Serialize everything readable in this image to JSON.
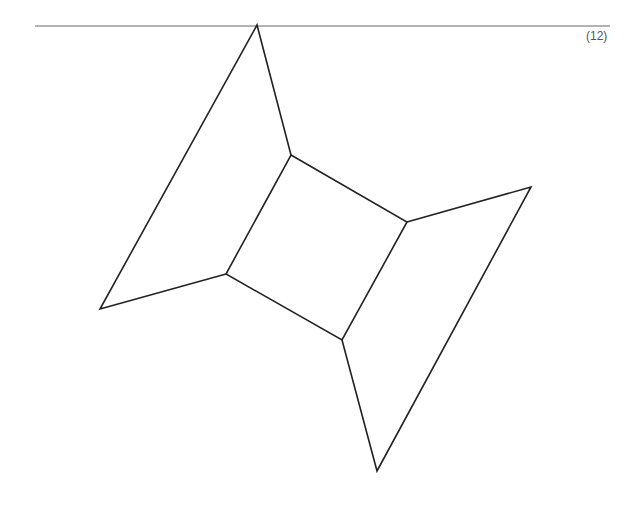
{
  "problem_number": "(12)",
  "figure": {
    "stroke_color": "#222222",
    "header_line_color": "#666666"
  }
}
